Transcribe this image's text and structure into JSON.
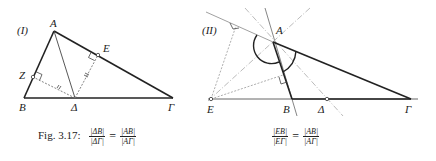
{
  "panel_I": {
    "label": "(I)",
    "points": {
      "A": "A",
      "B": "B",
      "Delta": "Δ",
      "Gamma": "Γ",
      "E": "E",
      "Z": "Z"
    }
  },
  "panel_II": {
    "label": "(II)",
    "points": {
      "A": "A",
      "B": "B",
      "Delta": "Δ",
      "Gamma": "Γ",
      "E": "E"
    }
  },
  "caption": {
    "prefix": "Fig. 3.17:",
    "eq1": {
      "lnum": "|ΔB|",
      "lden": "|ΔΓ|",
      "rnum": "|AB|",
      "rden": "|AΓ|"
    },
    "eq2": {
      "lnum": "|EB|",
      "lden": "|EΓ|",
      "rnum": "|AB|",
      "rden": "|AΓ|"
    },
    "equals": "="
  }
}
